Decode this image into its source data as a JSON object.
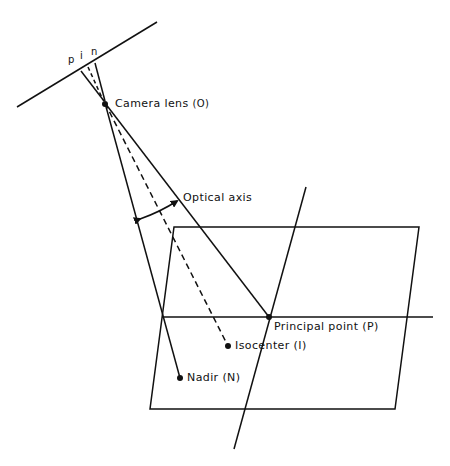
{
  "diagram": {
    "labels": {
      "p": "p",
      "i": "i",
      "n": "n",
      "camera_lens": "Camera lens",
      "camera_lens_symbol": "(O)",
      "optical_axis": "Optical axis",
      "principal_point": "Principal point (P)",
      "isocenter": "Isocenter (I)",
      "nadir": "Nadir (N)"
    },
    "points": {
      "lens": [
        105,
        103
      ],
      "film_p": [
        81,
        71
      ],
      "film_i": [
        88,
        67
      ],
      "film_n": [
        95,
        63
      ],
      "principal_point": [
        269,
        317
      ],
      "isocenter": [
        228,
        346
      ],
      "nadir": [
        180,
        378
      ]
    },
    "colors": {
      "ink": "#111111",
      "background": "#ffffff"
    }
  }
}
